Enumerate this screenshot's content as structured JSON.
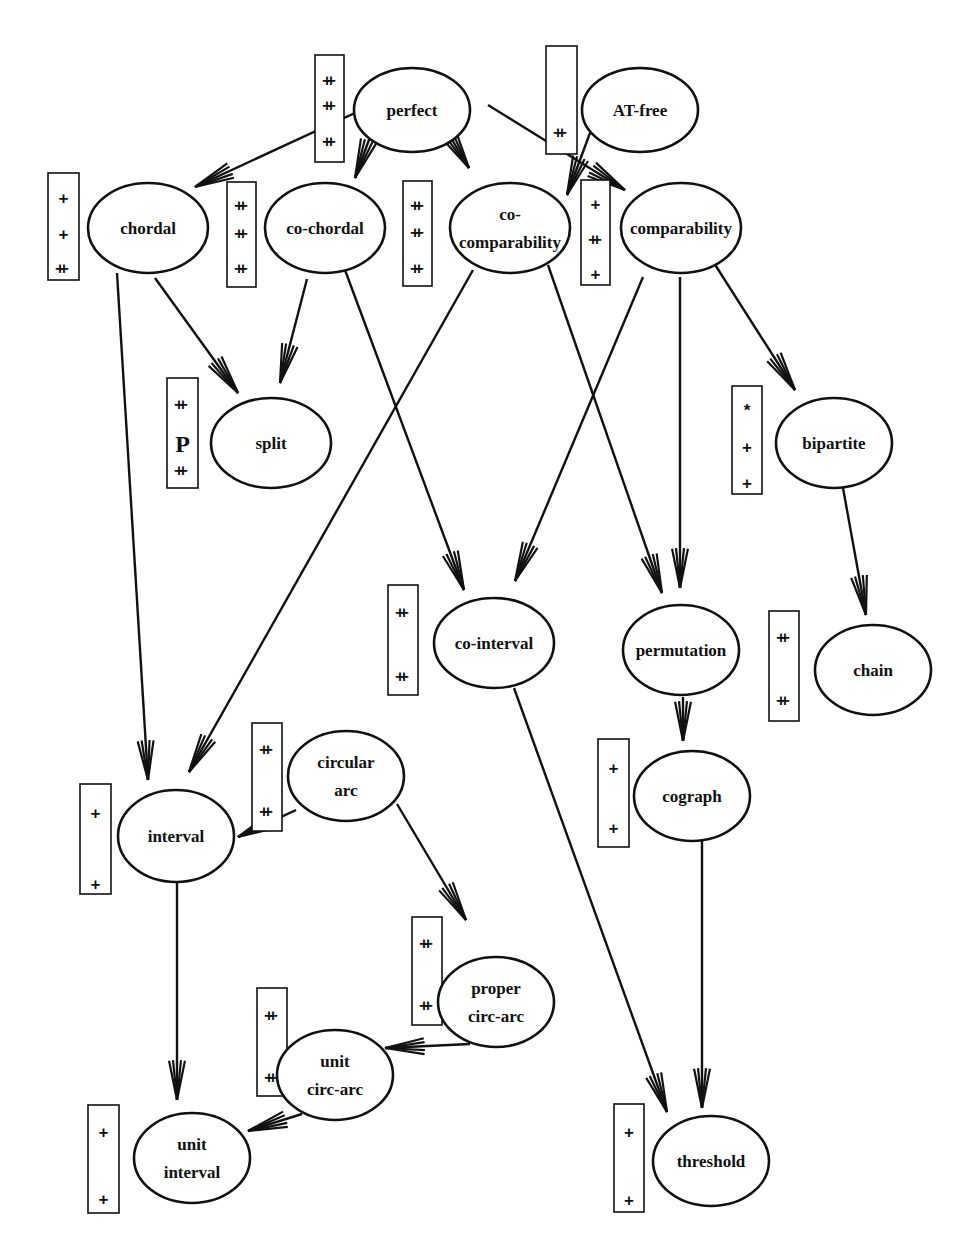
{
  "diagram": {
    "colors": {
      "stroke": "#111111",
      "background": "#ffffff"
    },
    "nodes": [
      {
        "id": "perfect",
        "lines": [
          "perfect"
        ],
        "cx": 412,
        "cy": 110,
        "rx": 58,
        "ry": 42
      },
      {
        "id": "at-free",
        "lines": [
          "AT-free"
        ],
        "cx": 640,
        "cy": 110,
        "rx": 58,
        "ry": 42
      },
      {
        "id": "chordal",
        "lines": [
          "chordal"
        ],
        "cx": 148,
        "cy": 228,
        "rx": 60,
        "ry": 45
      },
      {
        "id": "co-chordal",
        "lines": [
          "co-chordal"
        ],
        "cx": 325,
        "cy": 228,
        "rx": 60,
        "ry": 45
      },
      {
        "id": "co-comparability",
        "lines": [
          "co-",
          "comparability"
        ],
        "cx": 510,
        "cy": 228,
        "rx": 60,
        "ry": 45
      },
      {
        "id": "comparability",
        "lines": [
          "comparability"
        ],
        "cx": 681,
        "cy": 228,
        "rx": 60,
        "ry": 45
      },
      {
        "id": "split",
        "lines": [
          "split"
        ],
        "cx": 271,
        "cy": 443,
        "rx": 60,
        "ry": 45
      },
      {
        "id": "bipartite",
        "lines": [
          "bipartite"
        ],
        "cx": 834,
        "cy": 443,
        "rx": 58,
        "ry": 45
      },
      {
        "id": "co-interval",
        "lines": [
          "co-interval"
        ],
        "cx": 494,
        "cy": 643,
        "rx": 60,
        "ry": 45
      },
      {
        "id": "permutation",
        "lines": [
          "permutation"
        ],
        "cx": 681,
        "cy": 650,
        "rx": 58,
        "ry": 45
      },
      {
        "id": "chain",
        "lines": [
          "chain"
        ],
        "cx": 873,
        "cy": 670,
        "rx": 58,
        "ry": 45
      },
      {
        "id": "circular-arc",
        "lines": [
          "circular",
          "arc"
        ],
        "cx": 346,
        "cy": 776,
        "rx": 58,
        "ry": 45
      },
      {
        "id": "interval",
        "lines": [
          "interval"
        ],
        "cx": 176,
        "cy": 836,
        "rx": 58,
        "ry": 46
      },
      {
        "id": "cograph",
        "lines": [
          "cograph"
        ],
        "cx": 692,
        "cy": 796,
        "rx": 58,
        "ry": 45
      },
      {
        "id": "proper-circ-arc",
        "lines": [
          "proper",
          "circ-arc"
        ],
        "cx": 496,
        "cy": 1002,
        "rx": 58,
        "ry": 45
      },
      {
        "id": "unit-circ-arc",
        "lines": [
          "unit",
          "circ-arc"
        ],
        "cx": 335,
        "cy": 1075,
        "rx": 58,
        "ry": 45
      },
      {
        "id": "unit-interval",
        "lines": [
          "unit",
          "interval"
        ],
        "cx": 192,
        "cy": 1158,
        "rx": 58,
        "ry": 45
      },
      {
        "id": "threshold",
        "lines": [
          "threshold"
        ],
        "cx": 711,
        "cy": 1161,
        "rx": 58,
        "ry": 45
      }
    ],
    "boxes": [
      {
        "for": "perfect",
        "x": 315,
        "y": 55,
        "w": 29,
        "h": 107,
        "marks": [
          {
            "t": "++",
            "y": 80
          },
          {
            "t": "++",
            "y": 105
          },
          {
            "t": "++",
            "y": 141
          }
        ]
      },
      {
        "for": "at-free",
        "x": 546,
        "y": 46,
        "w": 31,
        "h": 108,
        "marks": [
          {
            "t": "++",
            "y": 132
          }
        ]
      },
      {
        "for": "chordal",
        "x": 48,
        "y": 173,
        "w": 31,
        "h": 107,
        "marks": [
          {
            "t": "+",
            "y": 198
          },
          {
            "t": "+",
            "y": 234
          },
          {
            "t": "++",
            "y": 268
          }
        ]
      },
      {
        "for": "co-chordal",
        "x": 227,
        "y": 182,
        "w": 29,
        "h": 105,
        "marks": [
          {
            "t": "++",
            "y": 205
          },
          {
            "t": "++",
            "y": 233
          },
          {
            "t": "++",
            "y": 268
          }
        ]
      },
      {
        "for": "co-comparability",
        "x": 403,
        "y": 181,
        "w": 29,
        "h": 105,
        "marks": [
          {
            "t": "++",
            "y": 205
          },
          {
            "t": "++",
            "y": 232
          },
          {
            "t": "++",
            "y": 268
          }
        ]
      },
      {
        "for": "comparability",
        "x": 581,
        "y": 180,
        "w": 29,
        "h": 105,
        "marks": [
          {
            "t": "+",
            "y": 204
          },
          {
            "t": "++",
            "y": 239
          },
          {
            "t": "+",
            "y": 274
          }
        ]
      },
      {
        "for": "split",
        "x": 167,
        "y": 378,
        "w": 31,
        "h": 110,
        "marks": [
          {
            "t": "++",
            "y": 404
          },
          {
            "t": "P",
            "y": 444
          },
          {
            "t": "++",
            "y": 470
          }
        ]
      },
      {
        "for": "bipartite",
        "x": 732,
        "y": 386,
        "w": 30,
        "h": 108,
        "marks": [
          {
            "t": "*",
            "y": 410
          },
          {
            "t": "+",
            "y": 447
          },
          {
            "t": "+",
            "y": 483
          }
        ]
      },
      {
        "for": "co-interval",
        "x": 388,
        "y": 585,
        "w": 30,
        "h": 110,
        "marks": [
          {
            "t": "++",
            "y": 612
          },
          {
            "t": "++",
            "y": 676
          }
        ]
      },
      {
        "for": "chain",
        "x": 769,
        "y": 611,
        "w": 30,
        "h": 110,
        "marks": [
          {
            "t": "++",
            "y": 637
          },
          {
            "t": "++",
            "y": 700
          }
        ]
      },
      {
        "for": "circular-arc",
        "x": 252,
        "y": 723,
        "w": 30,
        "h": 108,
        "marks": [
          {
            "t": "++",
            "y": 749
          },
          {
            "t": "++",
            "y": 811
          }
        ]
      },
      {
        "for": "interval",
        "x": 80,
        "y": 784,
        "w": 31,
        "h": 110,
        "marks": [
          {
            "t": "+",
            "y": 813
          },
          {
            "t": "+",
            "y": 884
          }
        ]
      },
      {
        "for": "cograph",
        "x": 598,
        "y": 739,
        "w": 31,
        "h": 108,
        "marks": [
          {
            "t": "+",
            "y": 768
          },
          {
            "t": "+",
            "y": 828
          }
        ]
      },
      {
        "for": "proper-circ-arc",
        "x": 412,
        "y": 917,
        "w": 30,
        "h": 108,
        "marks": [
          {
            "t": "++",
            "y": 943
          },
          {
            "t": "++",
            "y": 1005
          }
        ]
      },
      {
        "for": "unit-circ-arc",
        "x": 257,
        "y": 988,
        "w": 30,
        "h": 108,
        "marks": [
          {
            "t": "++",
            "y": 1015
          },
          {
            "t": "++",
            "y": 1077
          }
        ]
      },
      {
        "for": "unit-interval",
        "x": 88,
        "y": 1105,
        "w": 31,
        "h": 108,
        "marks": [
          {
            "t": "+",
            "y": 1132
          },
          {
            "t": "+",
            "y": 1199
          }
        ]
      },
      {
        "for": "threshold",
        "x": 614,
        "y": 1104,
        "w": 30,
        "h": 108,
        "marks": [
          {
            "t": "+",
            "y": 1132
          },
          {
            "t": "+",
            "y": 1200
          }
        ]
      }
    ],
    "edges": [
      {
        "from": "perfect",
        "to": "chordal",
        "x1": 357,
        "y1": 112,
        "x2": 195,
        "y2": 187
      },
      {
        "from": "perfect",
        "to": "co-chordal",
        "x1": 370,
        "y1": 137,
        "x2": 355,
        "y2": 178
      },
      {
        "from": "perfect",
        "to": "co-comparability",
        "x1": 445,
        "y1": 128,
        "x2": 469,
        "y2": 168
      },
      {
        "from": "perfect",
        "to": "comparability",
        "x1": 488,
        "y1": 105,
        "x2": 625,
        "y2": 190
      },
      {
        "from": "at-free",
        "to": "co-comparability",
        "x1": 590,
        "y1": 133,
        "x2": 567,
        "y2": 195
      },
      {
        "from": "chordal",
        "to": "split",
        "x1": 155,
        "y1": 278,
        "x2": 238,
        "y2": 393
      },
      {
        "from": "chordal",
        "to": "interval",
        "x1": 117,
        "y1": 273,
        "x2": 148,
        "y2": 780
      },
      {
        "from": "co-chordal",
        "to": "split",
        "x1": 307,
        "y1": 279,
        "x2": 280,
        "y2": 383
      },
      {
        "from": "co-chordal",
        "to": "co-interval",
        "x1": 345,
        "y1": 270,
        "x2": 464,
        "y2": 590
      },
      {
        "from": "co-comparability",
        "to": "interval",
        "x1": 473,
        "y1": 270,
        "x2": 189,
        "y2": 772
      },
      {
        "from": "co-comparability",
        "to": "permutation",
        "x1": 548,
        "y1": 265,
        "x2": 662,
        "y2": 593
      },
      {
        "from": "comparability",
        "to": "co-interval",
        "x1": 643,
        "y1": 277,
        "x2": 515,
        "y2": 581
      },
      {
        "from": "comparability",
        "to": "permutation",
        "x1": 680,
        "y1": 277,
        "x2": 680,
        "y2": 588
      },
      {
        "from": "comparability",
        "to": "bipartite",
        "x1": 714,
        "y1": 263,
        "x2": 795,
        "y2": 390
      },
      {
        "from": "bipartite",
        "to": "chain",
        "x1": 843,
        "y1": 488,
        "x2": 866,
        "y2": 615
      },
      {
        "from": "permutation",
        "to": "cograph",
        "x1": 683,
        "y1": 697,
        "x2": 683,
        "y2": 741
      },
      {
        "from": "circular-arc",
        "to": "interval",
        "x1": 296,
        "y1": 810,
        "x2": 238,
        "y2": 837
      },
      {
        "from": "circular-arc",
        "to": "proper-circ-arc",
        "x1": 397,
        "y1": 804,
        "x2": 466,
        "y2": 920
      },
      {
        "from": "interval",
        "to": "unit-interval",
        "x1": 177,
        "y1": 882,
        "x2": 177,
        "y2": 1100
      },
      {
        "from": "proper-circ-arc",
        "to": "unit-circ-arc",
        "x1": 470,
        "y1": 1044,
        "x2": 385,
        "y2": 1048
      },
      {
        "from": "unit-circ-arc",
        "to": "unit-interval",
        "x1": 302,
        "y1": 1114,
        "x2": 248,
        "y2": 1131
      },
      {
        "from": "co-interval",
        "to": "threshold",
        "x1": 514,
        "y1": 688,
        "x2": 667,
        "y2": 1112
      },
      {
        "from": "cograph",
        "to": "threshold",
        "x1": 702,
        "y1": 840,
        "x2": 702,
        "y2": 1108
      }
    ]
  }
}
